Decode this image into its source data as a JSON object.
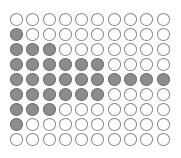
{
  "figure": {
    "type": "dot-grid",
    "columns": 10,
    "rows": 9,
    "filled_per_row": [
      0,
      1,
      3,
      6,
      10,
      6,
      3,
      1,
      0
    ],
    "fill_alignment": "left",
    "colors": {
      "filled": "#8c8c8c",
      "filled_border": "#6e6e6e",
      "empty": "#ffffff",
      "empty_border": "#8a8a8a"
    }
  }
}
